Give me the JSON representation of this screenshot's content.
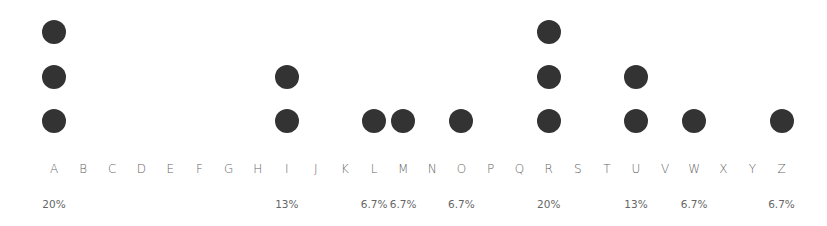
{
  "chart_data": {
    "type": "dot",
    "title": "",
    "xlabel": "",
    "ylabel": "",
    "categories": [
      "A",
      "B",
      "C",
      "D",
      "E",
      "F",
      "G",
      "H",
      "I",
      "J",
      "K",
      "L",
      "M",
      "N",
      "O",
      "P",
      "Q",
      "R",
      "S",
      "T",
      "U",
      "V",
      "W",
      "X",
      "Y",
      "Z"
    ],
    "values": [
      3,
      0,
      0,
      0,
      0,
      0,
      0,
      0,
      2,
      0,
      0,
      1,
      1,
      0,
      1,
      0,
      0,
      3,
      0,
      0,
      2,
      0,
      1,
      0,
      0,
      1
    ],
    "percent_labels": [
      "20%",
      "",
      "",
      "",
      "",
      "",
      "",
      "",
      "13%",
      "",
      "",
      "6.7%",
      "6.7%",
      "",
      "6.7%",
      "",
      "",
      "20%",
      "",
      "",
      "13%",
      "",
      "6.7%",
      "",
      "",
      "6.7%"
    ],
    "total": 15,
    "grid": false,
    "legend": null
  },
  "style": {
    "dot_color": "#333333",
    "label_color": "#666666"
  }
}
